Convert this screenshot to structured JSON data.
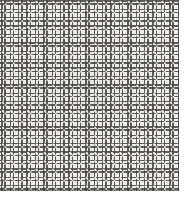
{
  "image": {
    "kind": "texture-photograph",
    "subject": "woven wire mesh screen",
    "description": "Close-up grayscale scan of a fine square-weave mesh fabric",
    "width_px": 187,
    "height_px": 206,
    "caption": ""
  },
  "texture": {
    "motif": "open square ring",
    "arrangement": "regular orthogonal grid",
    "cell_pitch_px": 8.4,
    "ring_stroke_px": 1.5,
    "ring_opening_px": 3.7,
    "columns_visible": 21,
    "rows_visible": 23,
    "orientation": "axis-aligned"
  },
  "region": {
    "pattern_left_px": 0,
    "pattern_top_px": 0,
    "pattern_width_px": 179,
    "pattern_height_px": 191,
    "margin_right_px": 8,
    "margin_bottom_px": 15
  },
  "edges": {
    "right_rule_x_px": 178,
    "bottom_rule_y_px": 190,
    "rule_label": "swatch boundary"
  },
  "colors": {
    "paper": "#fdfdfc",
    "margin": "#ffffff",
    "mesh_light": "#fbfaf8",
    "mesh_ink": "#4e4c48",
    "edge_rule": "#3c3a37",
    "field_tint": "#f6f5f3"
  }
}
